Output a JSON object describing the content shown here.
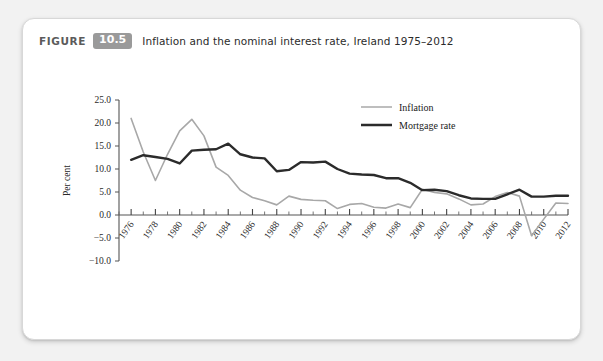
{
  "figure": {
    "label": "FIGURE",
    "number": "10.5",
    "title": "Inflation and the nominal interest rate, Ireland 1975–2012",
    "badge_color": "#9a9a9a"
  },
  "chart_data": {
    "type": "line",
    "title": "Inflation and the nominal interest rate, Ireland 1975–2012",
    "xlabel": "",
    "ylabel": "Per cent",
    "xlim": [
      1975,
      2012
    ],
    "ylim": [
      -10.0,
      25.0
    ],
    "grid": false,
    "legend_position": "top-right",
    "y_ticks": [
      25.0,
      20.0,
      15.0,
      10.0,
      5.0,
      0.0,
      -5.0,
      -10.0
    ],
    "y_tick_labels": [
      "25.0",
      "20.0",
      "15.0",
      "10.0",
      "5.0",
      "0.0",
      "−5.0",
      "−10.0"
    ],
    "x_ticks": [
      1976,
      1978,
      1980,
      1982,
      1984,
      1986,
      1988,
      1990,
      1992,
      1994,
      1996,
      1998,
      2000,
      2002,
      2004,
      2006,
      2008,
      2010,
      2012
    ],
    "x_tick_labels": [
      "1976",
      "1978",
      "1980",
      "1982",
      "1984",
      "1986",
      "1988",
      "1990",
      "1992",
      "1994",
      "1996",
      "1998",
      "2000",
      "2002",
      "2004",
      "2006",
      "2008",
      "2010",
      "2012"
    ],
    "x_minor_ticks": [
      1975,
      1977,
      1979,
      1981,
      1983,
      1985,
      1987,
      1989,
      1991,
      1993,
      1995,
      1997,
      1999,
      2001,
      2003,
      2005,
      2007,
      2009,
      2011
    ],
    "x": [
      1976,
      1977,
      1978,
      1979,
      1980,
      1981,
      1982,
      1983,
      1984,
      1985,
      1986,
      1987,
      1988,
      1989,
      1990,
      1991,
      1992,
      1993,
      1994,
      1995,
      1996,
      1997,
      1998,
      1999,
      2000,
      2001,
      2002,
      2003,
      2004,
      2005,
      2006,
      2007,
      2008,
      2009,
      2010,
      2011,
      2012
    ],
    "series": [
      {
        "name": "Inflation",
        "color": "#a8a8a8",
        "width": 1.6,
        "values": [
          21.0,
          13.7,
          7.5,
          13.2,
          18.3,
          20.8,
          17.2,
          10.4,
          8.6,
          5.4,
          3.8,
          3.1,
          2.2,
          4.1,
          3.4,
          3.2,
          3.1,
          1.4,
          2.3,
          2.5,
          1.7,
          1.5,
          2.4,
          1.6,
          5.6,
          4.9,
          4.6,
          3.5,
          2.2,
          2.4,
          4.0,
          4.9,
          4.1,
          -4.5,
          -0.9,
          2.6,
          2.5
        ]
      },
      {
        "name": "Mortgage rate",
        "color": "#2b2b2b",
        "width": 2.4,
        "values": [
          12.0,
          13.0,
          12.6,
          12.2,
          11.2,
          14.0,
          14.2,
          14.3,
          15.5,
          13.2,
          12.5,
          12.3,
          9.5,
          9.8,
          11.5,
          11.4,
          11.6,
          10.0,
          9.0,
          8.8,
          8.7,
          8.0,
          8.0,
          7.0,
          5.4,
          5.5,
          5.2,
          4.3,
          3.6,
          3.5,
          3.5,
          4.5,
          5.5,
          4.0,
          4.0,
          4.2,
          4.2
        ]
      }
    ]
  }
}
